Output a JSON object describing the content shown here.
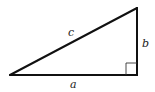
{
  "diagram": {
    "type": "right-triangle",
    "colors": {
      "stroke": "#111111",
      "marker": "#333333",
      "label": "#222222",
      "background": "#ffffff"
    },
    "sides": {
      "hypotenuse": {
        "label": "c"
      },
      "vertical_leg": {
        "label": "b"
      },
      "base_leg": {
        "label": "a"
      }
    },
    "right_angle_marker": true
  }
}
